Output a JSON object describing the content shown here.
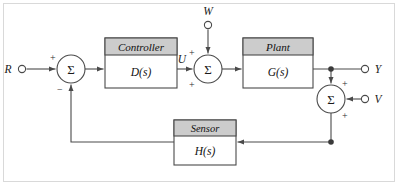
{
  "figure": {
    "type": "control-system-block-diagram",
    "frame": {
      "visible": true,
      "color": "#d9d9d9"
    },
    "line_color": "#4a4a4a",
    "block_header_fill": "#cccccc",
    "block_body_fill": "#ffffff",
    "block_border": "#4a4a4a"
  },
  "terminals": [
    {
      "id": "R",
      "label": "R",
      "kind": "input",
      "x": 22,
      "y": 69,
      "label_x": 12,
      "label_y": 72
    },
    {
      "id": "W",
      "label": "W",
      "kind": "input",
      "x": 208,
      "y": 25,
      "label_x": 208,
      "label_y": 13
    },
    {
      "id": "Y",
      "label": "Y",
      "kind": "output",
      "x": 366,
      "y": 69,
      "label_x": 377,
      "label_y": 72
    },
    {
      "id": "V",
      "label": "V",
      "kind": "input",
      "x": 366,
      "y": 99,
      "label_x": 377,
      "label_y": 102
    }
  ],
  "summing_junctions": [
    {
      "id": "sum-error",
      "symbol": "Σ",
      "cx": 71,
      "cy": 69,
      "r": 14,
      "signs": [
        {
          "text": "+",
          "x": 50,
          "y": 58
        },
        {
          "text": "−",
          "x": 59,
          "y": 90
        }
      ]
    },
    {
      "id": "sum-disturbance",
      "symbol": "Σ",
      "cx": 208,
      "cy": 69,
      "r": 14,
      "signs": [
        {
          "text": "+",
          "x": 191,
          "y": 53
        },
        {
          "text": "+",
          "x": 190,
          "y": 85
        }
      ]
    },
    {
      "id": "sum-noise",
      "symbol": "Σ",
      "cx": 331,
      "cy": 99,
      "r": 14,
      "signs": [
        {
          "text": "+",
          "x": 344,
          "y": 84
        },
        {
          "text": "+",
          "x": 344,
          "y": 116
        }
      ]
    }
  ],
  "blocks": [
    {
      "id": "controller",
      "title": "Controller",
      "body": "D(s)",
      "x": 105,
      "y": 38,
      "w": 72,
      "h": 50,
      "header_h": 17
    },
    {
      "id": "plant",
      "title": "Plant",
      "body": "G(s)",
      "x": 243,
      "y": 38,
      "w": 70,
      "h": 50,
      "header_h": 17
    },
    {
      "id": "sensor",
      "title": "Sensor",
      "body": "H(s)",
      "x": 174,
      "y": 120,
      "w": 62,
      "h": 45,
      "header_h": 16
    }
  ],
  "signal_labels": [
    {
      "id": "U",
      "text": "U",
      "x": 180,
      "y": 62
    }
  ],
  "junction_dots": [
    {
      "id": "output-tap",
      "x": 331,
      "y": 69
    },
    {
      "id": "feedback-tap",
      "x": 331,
      "y": 142
    }
  ],
  "edges": [
    {
      "id": "r-to-sum",
      "from": "R",
      "to": "sum-error"
    },
    {
      "id": "sum-to-controller",
      "from": "sum-error",
      "to": "controller"
    },
    {
      "id": "controller-to-sum",
      "from": "controller",
      "to": "sum-disturbance"
    },
    {
      "id": "w-to-sum",
      "from": "W",
      "to": "sum-disturbance"
    },
    {
      "id": "sum-to-plant",
      "from": "sum-disturbance",
      "to": "plant"
    },
    {
      "id": "plant-to-output",
      "from": "plant",
      "to": "Y"
    },
    {
      "id": "output-to-sum-noise",
      "from": "output-tap",
      "to": "sum-noise"
    },
    {
      "id": "v-to-sum-noise",
      "from": "V",
      "to": "sum-noise"
    },
    {
      "id": "sum-noise-to-sensor",
      "from": "sum-noise",
      "to": "sensor"
    },
    {
      "id": "sensor-to-sum-error",
      "from": "sensor",
      "to": "sum-error"
    }
  ]
}
